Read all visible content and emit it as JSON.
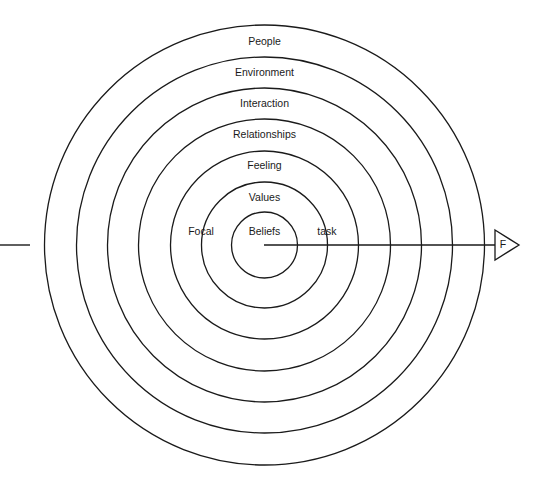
{
  "diagram": {
    "type": "concentric-circles",
    "center": {
      "x": 264.5,
      "y": 245
    },
    "rings": [
      {
        "label": "People",
        "radius": 220,
        "label_y": 42
      },
      {
        "label": "Environment",
        "radius": 188,
        "label_y": 73
      },
      {
        "label": "Interaction",
        "radius": 157,
        "label_y": 104
      },
      {
        "label": "Relationships",
        "radius": 126,
        "label_y": 135
      },
      {
        "label": "Feeling",
        "radius": 94,
        "label_y": 166
      },
      {
        "label": "Values",
        "radius": 63,
        "label_y": 198
      },
      {
        "label": "Beliefs",
        "radius": 33,
        "label_y": 232
      }
    ],
    "axis": {
      "x_start": 30,
      "x_end": 495,
      "y": 245,
      "left_label": "Focal",
      "right_label": "task",
      "arrow_label": "F"
    }
  }
}
